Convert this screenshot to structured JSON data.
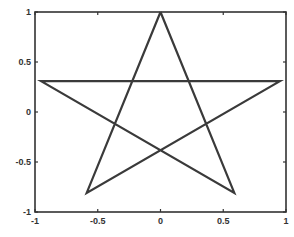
{
  "chart_data": {
    "type": "line",
    "title": "",
    "xlabel": "",
    "ylabel": "",
    "xlim": [
      -1,
      1
    ],
    "ylim": [
      -1,
      1
    ],
    "grid": false,
    "legend": null,
    "xticks": [
      -1,
      -0.5,
      0,
      0.5,
      1
    ],
    "yticks": [
      -1,
      -0.5,
      0,
      0.5,
      1
    ],
    "xtick_labels": [
      "-1",
      "-0.5",
      "0",
      "0.5",
      "1"
    ],
    "ytick_labels": [
      "-1",
      "-0.5",
      "0",
      "0.5",
      "1"
    ],
    "series": [
      {
        "name": "pentagram",
        "color": "#3a3a3a",
        "x": [
          0,
          0.588,
          -0.951,
          0.951,
          -0.588,
          0
        ],
        "y": [
          1,
          -0.809,
          0.309,
          0.309,
          -0.809,
          1
        ]
      }
    ]
  },
  "style": {
    "axis_color": "#333333",
    "line_color": "#3a3a3a",
    "background": "#ffffff"
  }
}
